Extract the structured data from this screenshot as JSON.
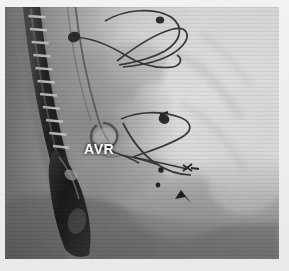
{
  "figure": {
    "modality": "fluoroscopy",
    "view": "lateral chest fluoroscopic still",
    "width": 289,
    "height": 271,
    "background_color": "#efefef",
    "frame": {
      "x": 5,
      "y": 7,
      "width": 274,
      "height": 252,
      "base_color": "#b8b8b8",
      "dark_color": "#2a2a2a",
      "bright_color": "#e6e6e6"
    }
  },
  "annotations": [
    {
      "id": "avr-label",
      "name": "avr-text-annotation",
      "text": "AVR",
      "color": "#ffffff",
      "x": 84,
      "y": 142,
      "font_size_px": 14,
      "font_weight": "bold",
      "description": "white bold overlay text marking the aortic valve replacement prosthesis"
    }
  ],
  "markers": [
    {
      "id": "marker-dot-1",
      "name": "radiopaque-marker-dot",
      "shape": "dot",
      "cx": 160,
      "cy": 166,
      "r": 2.6,
      "color": "#1a1a1a"
    },
    {
      "id": "marker-dot-2",
      "name": "radiopaque-marker-dot",
      "shape": "dot",
      "cx": 157,
      "cy": 180,
      "r": 2.4,
      "color": "#1a1a1a"
    },
    {
      "id": "marker-arrowhead-1",
      "name": "arrowhead-pointer",
      "shape": "arrowhead",
      "tip_x": 181,
      "tip_y": 186,
      "angle_deg": 215,
      "color": "#141414"
    }
  ],
  "structures": [
    {
      "id": "tee-probe",
      "name": "tee-probe-shaft",
      "label": "Transesophageal echo probe",
      "tone": "very-dark",
      "region": "left vertical segmented band"
    },
    {
      "id": "tee-tip",
      "name": "tee-probe-tip",
      "label": "TEE probe transducer tip",
      "tone": "very-dark",
      "region": "lower-left ovoid"
    },
    {
      "id": "spine",
      "name": "vertebral-column",
      "label": "Vertebral bodies",
      "tone": "mid-dark",
      "region": "left column"
    },
    {
      "id": "catheter",
      "name": "catheter-line",
      "label": "Catheter / guidewire",
      "tone": "dark-line",
      "region": "centre descending to valve"
    },
    {
      "id": "prosthetic-valve",
      "name": "prosthetic-aortic-valve",
      "label": "AVR prosthesis ring",
      "tone": "dark-ring",
      "region": "centre near AVR label"
    },
    {
      "id": "ecg-leads-upper",
      "name": "ecg-lead-wires-upper",
      "label": "ECG lead wires (upper)",
      "tone": "dark-line",
      "region": "upper centre-right"
    },
    {
      "id": "ecg-leads-lower",
      "name": "ecg-lead-wires-lower",
      "label": "ECG lead wires (lower)",
      "tone": "dark-line",
      "region": "mid centre-right"
    },
    {
      "id": "lung-field",
      "name": "lung-field",
      "label": "Radiolucent lung field",
      "tone": "bright",
      "region": "right two thirds"
    },
    {
      "id": "mediastinum",
      "name": "mediastinal-soft-tissue",
      "label": "Mediastinal soft tissue",
      "tone": "mid",
      "region": "centre-left"
    },
    {
      "id": "diaphragm",
      "name": "diaphragm-shadow",
      "label": "Diaphragmatic shadow",
      "tone": "mid-dark",
      "region": "lower band"
    }
  ],
  "electrode_clips": [
    {
      "id": "clip-1",
      "name": "ecg-electrode-clip",
      "cx": 69,
      "cy": 30,
      "rx": 6,
      "ry": 5
    },
    {
      "id": "clip-2",
      "name": "ecg-electrode-clip",
      "cx": 155,
      "cy": 14,
      "rx": 4,
      "ry": 4
    },
    {
      "id": "clip-3",
      "name": "ecg-electrode-clip",
      "cx": 160,
      "cy": 113,
      "rx": 5,
      "ry": 5
    }
  ]
}
